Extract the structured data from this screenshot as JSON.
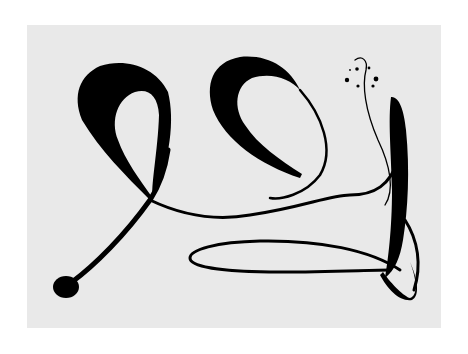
{
  "artwork": {
    "description": "Abstract black ink calligraphic loops on white paper",
    "colors": {
      "ink": "#000000",
      "paper": "#e9e9e9",
      "background": "#ffffff"
    }
  }
}
